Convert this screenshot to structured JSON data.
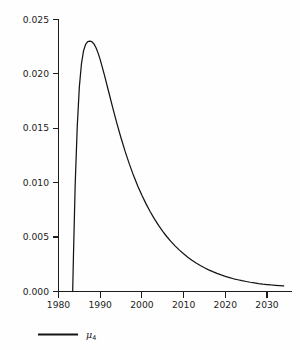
{
  "chart_data": {
    "type": "line",
    "title": "",
    "xlabel": "",
    "ylabel": "",
    "xlim": [
      1980,
      2034
    ],
    "ylim": [
      0.0,
      0.025
    ],
    "grid": false,
    "legend_position": "bottom-left",
    "legend": [
      {
        "name": "mu_4",
        "display": "μ",
        "subscript": "4",
        "color": "#141414"
      }
    ],
    "series": [
      {
        "name": "μ₄",
        "color": "#141414",
        "x": [
          1983.4,
          1983.6,
          1984.0,
          1984.5,
          1985.0,
          1985.5,
          1986.0,
          1986.5,
          1987.0,
          1987.5,
          1988.0,
          1988.5,
          1989.0,
          1989.5,
          1990.0,
          1991.0,
          1992.0,
          1993.0,
          1994.0,
          1995.0,
          1996.0,
          1997.0,
          1998.0,
          1999.0,
          2000.0,
          2001.0,
          2002.0,
          2003.0,
          2004.0,
          2005.0,
          2006.0,
          2007.0,
          2008.0,
          2009.0,
          2010.0,
          2011.0,
          2012.0,
          2013.0,
          2014.0,
          2015.0,
          2016.0,
          2017.0,
          2018.0,
          2019.0,
          2020.0,
          2021.0,
          2022.0,
          2023.0,
          2024.0,
          2025.0,
          2026.0,
          2027.0,
          2028.0,
          2029.0,
          2030.0,
          2031.0,
          2032.0,
          2033.0,
          2034.0
        ],
        "y": [
          0.0,
          0.0035,
          0.0098,
          0.0152,
          0.0188,
          0.0209,
          0.0221,
          0.0227,
          0.02295,
          0.023,
          0.02295,
          0.02275,
          0.0224,
          0.0219,
          0.0213,
          0.0199,
          0.0184,
          0.0169,
          0.01545,
          0.0141,
          0.01285,
          0.0117,
          0.01065,
          0.0097,
          0.00885,
          0.00805,
          0.00733,
          0.00667,
          0.00607,
          0.00553,
          0.00503,
          0.00458,
          0.00417,
          0.0038,
          0.00346,
          0.00315,
          0.00287,
          0.00262,
          0.00239,
          0.00218,
          0.00199,
          0.00182,
          0.00166,
          0.00152,
          0.00139,
          0.00128,
          0.00117,
          0.00108,
          0.00099,
          0.00092,
          0.00085,
          0.00079,
          0.00073,
          0.00068,
          0.00064,
          0.0006,
          0.00057,
          0.00054,
          0.00051
        ]
      }
    ],
    "yticks": [
      0.0,
      0.005,
      0.01,
      0.015,
      0.02,
      0.025
    ],
    "ytick_labels": [
      "0.000",
      "0.005",
      "0.010",
      "0.015",
      "0.020",
      "0.025"
    ],
    "xticks": [
      1980,
      1990,
      2000,
      2010,
      2020,
      2030
    ],
    "xtick_labels": [
      "1980",
      "1990",
      "2000",
      "2010",
      "2020",
      "2030"
    ],
    "peak": {
      "x": 1987.6,
      "y": 0.023
    }
  },
  "axes": {
    "y_tick_0": "0.000",
    "y_tick_1": "0.005",
    "y_tick_2": "0.010",
    "y_tick_3": "0.015",
    "y_tick_4": "0.020",
    "y_tick_5": "0.025",
    "x_tick_0": "1980",
    "x_tick_1": "1990",
    "x_tick_2": "2000",
    "x_tick_3": "2010",
    "x_tick_4": "2020",
    "x_tick_5": "2030"
  },
  "legend": {
    "symbol": "μ",
    "subscript": "4"
  },
  "colors": {
    "curve": "#141414",
    "axis": "#1c1c1c",
    "background": "#fefefe"
  }
}
